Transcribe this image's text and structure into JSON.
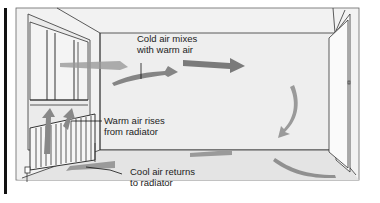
{
  "diagram": {
    "labels": {
      "cold_air_line1": "Cold air mixes",
      "cold_air_line2": "with warm air",
      "warm_air_line1": "Warm air rises",
      "warm_air_line2": "from radiator",
      "cool_air_line1": "Cool air returns",
      "cool_air_line2": "to radiator"
    },
    "elements": [
      "window",
      "radiator",
      "door",
      "airflow-arrows",
      "room-walls"
    ],
    "colors": {
      "background": "#ffffff",
      "wall": "#efefef",
      "floor": "#e6e6e6",
      "line": "#333333",
      "arrow": "#808080",
      "text": "#222222"
    }
  }
}
